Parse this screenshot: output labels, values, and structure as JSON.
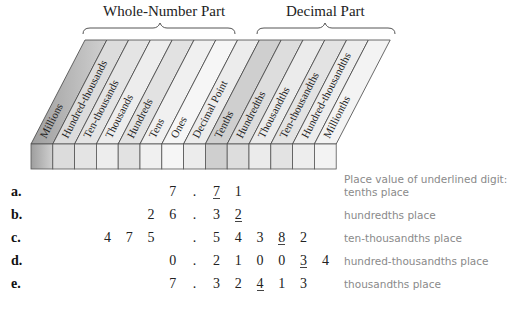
{
  "header": {
    "whole_part_label": "Whole-Number Part",
    "decimal_part_label": "Decimal Part"
  },
  "columns": [
    {
      "label": "Millions",
      "shade": "#bdbdbd"
    },
    {
      "label": "Hundred-thousands",
      "shade": "#dcdcdc"
    },
    {
      "label": "Ten-thousands",
      "shade": "#e4e4e4"
    },
    {
      "label": "Thousands",
      "shade": "#ededed"
    },
    {
      "label": "Hundreds",
      "shade": "#e2e2e2"
    },
    {
      "label": "Tens",
      "shade": "#f0f0f0"
    },
    {
      "label": "Ones",
      "shade": "#f6f6f6"
    },
    {
      "label": "Decimal Point",
      "shade": "#ececec"
    },
    {
      "label": "Tenths",
      "shade": "#cfcfcf"
    },
    {
      "label": "Hundredths",
      "shade": "#dddddd"
    },
    {
      "label": "Thousandths",
      "shade": "#ebebeb"
    },
    {
      "label": "Ten-thousandths",
      "shade": "#e3e3e3"
    },
    {
      "label": "Hundred-thousandths",
      "shade": "#ededed"
    },
    {
      "label": "Millionths",
      "shade": "#f3f3f3"
    }
  ],
  "caption_header": "Place value of underlined digit:",
  "rows": [
    {
      "label": "a.",
      "digits": [
        "",
        "",
        "",
        "",
        "",
        "",
        "7",
        ".",
        "7",
        "1",
        "",
        "",
        "",
        ""
      ],
      "underline_index": 8,
      "caption": "tenths place"
    },
    {
      "label": "b.",
      "digits": [
        "",
        "",
        "",
        "",
        "",
        "2",
        "6",
        ".",
        "3",
        "2",
        "",
        "",
        "",
        ""
      ],
      "underline_index": 9,
      "caption": "hundredths place"
    },
    {
      "label": "c.",
      "digits": [
        "",
        "",
        "",
        "4",
        "7",
        "5",
        "",
        ".",
        "5",
        "4",
        "3",
        "8",
        "2",
        ""
      ],
      "underline_index": 11,
      "caption": "ten-thousandths place"
    },
    {
      "label": "d.",
      "digits": [
        "",
        "",
        "",
        "",
        "",
        "",
        "0",
        ".",
        "2",
        "1",
        "0",
        "0",
        "3",
        "4"
      ],
      "underline_index": 12,
      "caption": "hundred-thousandths place"
    },
    {
      "label": "e.",
      "digits": [
        "",
        "",
        "",
        "",
        "",
        "",
        "7",
        ".",
        "3",
        "2",
        "4",
        "1",
        "3",
        ""
      ],
      "underline_index": 10,
      "caption": "thousandths place"
    }
  ]
}
